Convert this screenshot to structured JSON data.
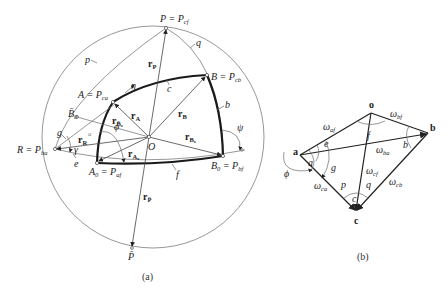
{
  "figure_a": {
    "caption": "(a)",
    "points": {
      "P": {
        "label": "P = P",
        "sub": "cf"
      },
      "B": {
        "label": "B = P",
        "sub": "cb"
      },
      "A": {
        "label": "A = P",
        "sub": "ca"
      },
      "R": {
        "label": "R = P",
        "sub": "ba"
      },
      "A0": {
        "label": "A",
        "sub0": "0",
        "eq": " = P",
        "sub": "af"
      },
      "B0": {
        "label": "B",
        "sub0": "0",
        "eq": " = P",
        "sub": "bf"
      },
      "B0bar": {
        "label": "B̄",
        "sub": "0"
      },
      "O": {
        "label": "O"
      },
      "Pbar": {
        "label": "P̄"
      }
    },
    "arc_labels": {
      "p": "p",
      "q": "q",
      "b": "b",
      "c": "c",
      "e": "e",
      "f": "f",
      "g": "g",
      "a": "a"
    },
    "angle_labels": {
      "eta": "η",
      "phi": "ϕ",
      "psi": "ψ",
      "gamma": "γ"
    },
    "vectors": {
      "rP": {
        "label": "r",
        "sub": "P"
      },
      "rA": {
        "label": "r",
        "sub": "A"
      },
      "rB": {
        "label": "r",
        "sub": "B"
      },
      "rB0bar": {
        "label": "r",
        "sub": "B̄₀"
      },
      "rB0": {
        "label": "r",
        "sub": "B₀"
      },
      "rA0": {
        "label": "r",
        "sub": "A₀"
      },
      "rR": {
        "label": "r",
        "sub": "R"
      },
      "rPbar": {
        "label": "r",
        "sub": "P̄"
      }
    }
  },
  "figure_b": {
    "caption": "(b)",
    "vertices": {
      "o": "o",
      "a": "a",
      "b": "b",
      "c": "c"
    },
    "edges": {
      "w_af": {
        "label": "ω",
        "sub": "af"
      },
      "w_bf": {
        "label": "ω",
        "sub": "bf"
      },
      "w_ba": {
        "label": "ω",
        "sub": "ba"
      },
      "w_cf": {
        "label": "ω",
        "sub": "cf"
      },
      "w_ca": {
        "label": "ω",
        "sub": "ca"
      },
      "w_cb": {
        "label": "ω",
        "sub": "cb"
      }
    },
    "angle_labels": {
      "e": "e",
      "f": "f",
      "a": "a",
      "g": "g",
      "b": "b",
      "p": "p",
      "q": "q",
      "c": "c",
      "phi": "ϕ"
    }
  }
}
